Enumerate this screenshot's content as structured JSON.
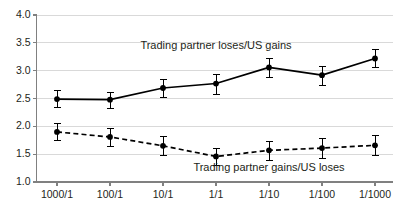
{
  "chart_data": {
    "type": "line",
    "title": "",
    "xlabel": "",
    "ylabel": "",
    "categories": [
      "1000/1",
      "100/1",
      "10/1",
      "1/1",
      "1/10",
      "1/100",
      "1/1000"
    ],
    "ylim": [
      1.0,
      4.0
    ],
    "yticks": [
      "1.0",
      "1.5",
      "2.0",
      "2.5",
      "3.0",
      "3.5",
      "4.0"
    ],
    "ytick_values": [
      1.0,
      1.5,
      2.0,
      2.5,
      3.0,
      3.5,
      4.0
    ],
    "grid": true,
    "legend_position": "inline-annotation",
    "series": [
      {
        "name": "Trading partner loses/US gains",
        "style": "solid",
        "marker": "circle",
        "values": [
          2.48,
          2.47,
          2.68,
          2.76,
          3.05,
          2.91,
          3.21
        ],
        "error_low": [
          2.33,
          2.32,
          2.52,
          2.58,
          2.88,
          2.74,
          3.05
        ],
        "error_high": [
          2.64,
          2.61,
          2.85,
          2.94,
          3.22,
          3.08,
          3.38
        ]
      },
      {
        "name": "Trading partner gains/US loses",
        "style": "dashed",
        "marker": "circle",
        "values": [
          1.89,
          1.8,
          1.64,
          1.45,
          1.56,
          1.6,
          1.65
        ],
        "error_low": [
          1.74,
          1.64,
          1.48,
          1.29,
          1.39,
          1.43,
          1.48
        ],
        "error_high": [
          2.05,
          1.96,
          1.81,
          1.61,
          1.73,
          1.78,
          1.83
        ]
      }
    ],
    "annotations": [
      {
        "text": "Trading partner loses/US gains",
        "x_category": "1/1",
        "y": 3.46
      },
      {
        "text": "Trading partner gains/US loses",
        "x_category": "1/10",
        "y": 1.26
      }
    ],
    "colors": {
      "line": "#000000",
      "grid": "#d9d9d9",
      "axis": "#808080",
      "text": "#231f20",
      "background": "#ffffff"
    }
  }
}
